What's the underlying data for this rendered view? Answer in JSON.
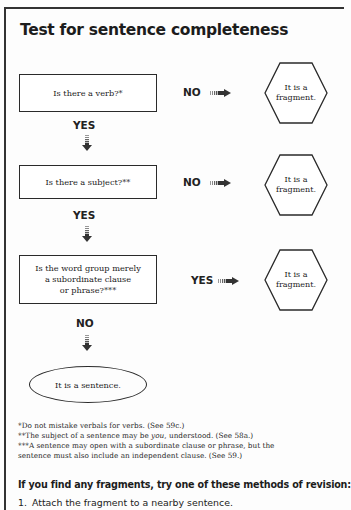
{
  "title": "Test for sentence completeness",
  "flowchart": {
    "steps": [
      {
        "question": "Is there a verb?*",
        "branch_label": "NO",
        "outcome": "It is a fragment.",
        "continue_label": "YES"
      },
      {
        "question": "Is there a subject?**",
        "branch_label": "NO",
        "outcome": "It is a fragment.",
        "continue_label": "YES"
      },
      {
        "question": "Is the word group merely a subordinate clause or phrase?***",
        "branch_label": "YES",
        "outcome": "It is a fragment.",
        "continue_label": "NO"
      }
    ],
    "hex_line1": "It is a",
    "hex_line2": "fragment.",
    "q3_line1": "Is the word group merely",
    "q3_line2": "a subordinate clause",
    "q3_line3": "or phrase?***",
    "final": "It is a sentence."
  },
  "footnotes": [
    "*Do not mistake verbals for verbs. (See 59c.)",
    "**The subject of a sentence may be ",
    "***A sentence may open with a subordinate clause or phrase, but the",
    "sentence must also include an independent clause. (See 59.)"
  ],
  "footnote2_italic": "you",
  "footnote2_tail": ", understood. (See 58a.)",
  "revision": {
    "heading": "If you find any fragments, try one of these methods of revision:",
    "items": [
      {
        "number": "1.",
        "text": "Attach the fragment to a nearby sentence."
      }
    ]
  },
  "colors": {
    "line": "#2a2a2a",
    "arrow": "#333333",
    "background": "#fdfdfd"
  }
}
